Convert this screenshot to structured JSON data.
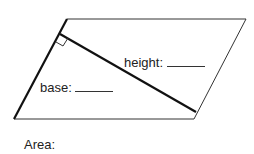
{
  "diagram": {
    "type": "parallelogram",
    "vertices": {
      "top_left": [
        67,
        19
      ],
      "top_right": [
        246,
        19
      ],
      "bottom_right": [
        194,
        119
      ],
      "bottom_left": [
        14,
        119
      ]
    },
    "base_side": "left",
    "height_segment": {
      "from": [
        60,
        34
      ],
      "to": [
        196,
        112
      ]
    },
    "right_angle_marker": true,
    "colors": {
      "stroke": "#111111",
      "background": "#ffffff"
    }
  },
  "labels": {
    "height": "height:",
    "base": "base:",
    "area": "Area:"
  }
}
